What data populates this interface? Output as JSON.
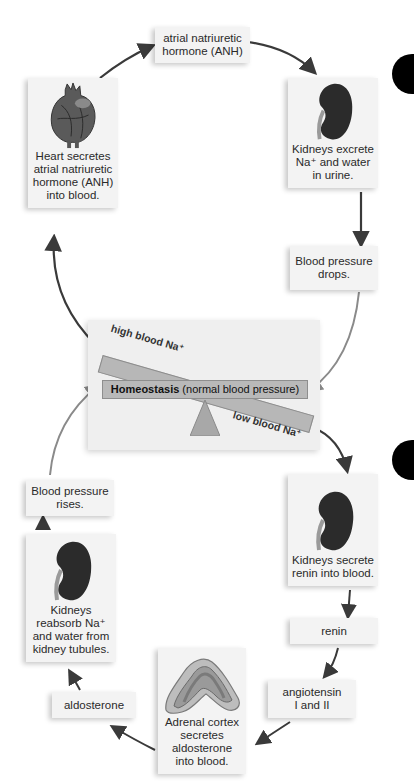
{
  "diagram": {
    "center": {
      "label_bold": "Homeostasis",
      "label_rest": " (normal blood pressure)",
      "high_label": "high blood Na⁺",
      "low_label": "low blood Na⁺"
    },
    "top_loop": {
      "heart": "Heart secretes\natrial natriuretic\nhormone (ANH)\ninto blood.",
      "anh": "atrial natriuretic\nhormone (ANH)",
      "kidneys_excrete": "Kidneys excrete\nNa⁺ and water\nin urine.",
      "bp_drops": "Blood pressure\ndrops."
    },
    "bottom_loop": {
      "kidneys_secrete": "Kidneys secrete\nrenin into blood.",
      "renin": "renin",
      "angiotensin": "angiotensin\nI and II",
      "adrenal": "Adrenal cortex\nsecretes\naldosterone\ninto blood.",
      "aldosterone": "aldosterone",
      "kidneys_reabsorb": "Kidneys\nreabsorb Na⁺\nand water from\nkidney tubules.",
      "bp_rises": "Blood pressure\nrises."
    },
    "colors": {
      "box_bg": "#f3f3f3",
      "bar_fill": "#b9b9b9",
      "fulcrum": "#a8a8a8",
      "arrow_dark": "#3a3a3a",
      "arrow_light": "#8a8a8a",
      "kidney": "#2b2b2b",
      "marker": "#000000"
    }
  }
}
